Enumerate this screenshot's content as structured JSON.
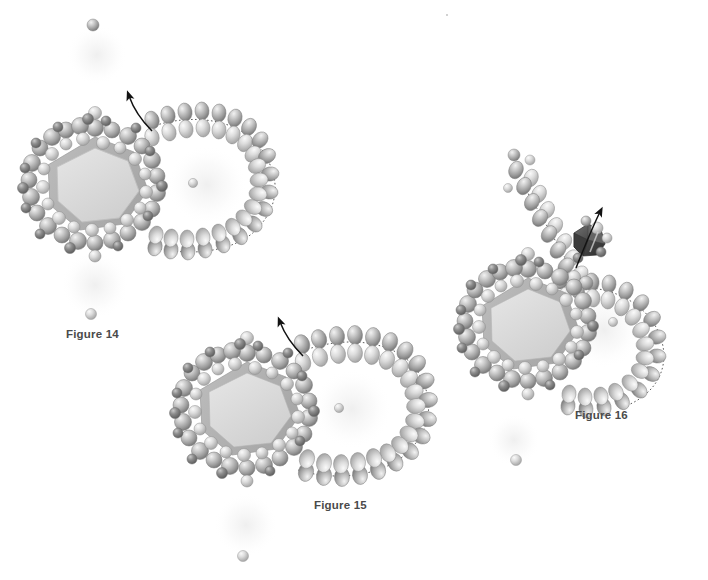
{
  "page": {
    "background_color": "#ffffff",
    "width": 708,
    "height": 580
  },
  "palette": {
    "background": "#ffffff",
    "bead_light": "#e8e8e8",
    "bead_mid": "#9e9e9e",
    "bead_dark": "#6e6e6e",
    "bead_outline": "#7a7a7a",
    "core_face_light": "#dcdcdc",
    "core_face_mid": "#c2c2c2",
    "core_face_dark": "#a6a6a6",
    "core_outline": "#8c8c8c",
    "dark_particle": "#4a4a4a",
    "dark_particle_light": "#8f8f8f",
    "arrow": "#121212",
    "dotted_line": "#2b2b2b",
    "halo": "#f3f3f3",
    "label_text": "#4a4a4a"
  },
  "figures": [
    {
      "id": "figure-14",
      "label": "Figure 14",
      "label_x": 66,
      "label_y": 328,
      "caption_position": "below-left",
      "core": {
        "cx": 95,
        "cy": 187,
        "radius": 52,
        "facets": 7,
        "shape": "faceted-polyhedron",
        "shell_bead_count": 62
      },
      "membrane": {
        "shape": "open-loop-bilayer",
        "description": "Lipid bilayer loop extending right from capsid, enclosing an empty vesicle lumen",
        "bilayer_pairs": 34,
        "lumen_cx": 208,
        "lumen_cy": 186,
        "lumen_rx": 52,
        "lumen_ry": 42,
        "state": "membrane wrapped around budding particle"
      },
      "arrow": {
        "from_x": 137,
        "from_y": 127,
        "to_x": 127,
        "to_y": 88,
        "curved": true,
        "head": "solid-triangle",
        "direction": "up-left"
      },
      "free_beads": [
        {
          "x": 93,
          "y": 25,
          "r": 6
        },
        {
          "x": 91,
          "y": 314,
          "r": 5.5
        },
        {
          "x": 193,
          "y": 183,
          "r": 4.5
        }
      ],
      "halos": [
        {
          "cx": 97,
          "cy": 55,
          "r": 30
        },
        {
          "cx": 95,
          "cy": 285,
          "r": 34
        },
        {
          "cx": 207,
          "cy": 185,
          "r": 38
        }
      ]
    },
    {
      "id": "figure-15",
      "label": "Figure 15",
      "label_x": 314,
      "label_y": 499,
      "caption_position": "below-right",
      "core": {
        "cx": 247,
        "cy": 412,
        "radius": 52,
        "facets": 7,
        "shape": "faceted-polyhedron",
        "shell_bead_count": 62
      },
      "membrane": {
        "shape": "open-loop-bilayer",
        "description": "Lipid bilayer stretched further right, neck narrowing as particle buds",
        "bilayer_pairs": 36,
        "lumen_cx": 352,
        "lumen_cy": 410,
        "lumen_rx": 52,
        "lumen_ry": 44,
        "state": "membrane stretched, neck forming"
      },
      "arrow": {
        "from_x": 288,
        "from_y": 352,
        "to_x": 278,
        "to_y": 318,
        "curved": true,
        "head": "solid-triangle",
        "direction": "up-left"
      },
      "free_beads": [
        {
          "x": 243,
          "y": 556,
          "r": 5.5
        },
        {
          "x": 339,
          "y": 408,
          "r": 4.5
        }
      ],
      "halos": [
        {
          "cx": 246,
          "cy": 525,
          "r": 32
        },
        {
          "cx": 352,
          "cy": 409,
          "r": 38
        }
      ]
    },
    {
      "id": "figure-16",
      "label": "Figure 16",
      "label_x": 575,
      "label_y": 409,
      "caption_position": "below-center",
      "core": {
        "cx": 528,
        "cy": 326,
        "radius": 50,
        "facets": 7,
        "shape": "faceted-polyhedron",
        "shell_bead_count": 60
      },
      "membrane": {
        "shape": "split-bilayer",
        "description": "Bilayer scissioned open; upper and lower leaflets separate as enveloped particle is released",
        "bilayer_pairs": 40,
        "lumen_cx": 604,
        "lumen_cy": 330,
        "lumen_rx": 48,
        "lumen_ry": 42,
        "state": "membrane fission, particle released"
      },
      "arrow": {
        "from_x": 578,
        "from_y": 255,
        "to_x": 598,
        "to_y": 208,
        "curved": true,
        "head": "solid-triangle",
        "direction": "up-right"
      },
      "released_particle": {
        "cx": 588,
        "cy": 240,
        "r": 16,
        "color": "#4a4a4a",
        "shape": "dark-faceted-polyhedron",
        "description": "Released dark capsid particle with attached surface beads"
      },
      "free_beads": [
        {
          "x": 516,
          "y": 460,
          "r": 5.5
        },
        {
          "x": 613,
          "y": 322,
          "r": 4.5
        }
      ],
      "halos": [
        {
          "cx": 520,
          "cy": 290,
          "r": 32
        },
        {
          "cx": 604,
          "cy": 330,
          "r": 36
        },
        {
          "cx": 514,
          "cy": 440,
          "r": 26
        }
      ]
    }
  ],
  "legend": {
    "bead_meaning": "phospholipid head / capsid protein subunit",
    "dotted_line_meaning": "bilayer mid-plane",
    "arrow_meaning": "direction of budding / release"
  }
}
